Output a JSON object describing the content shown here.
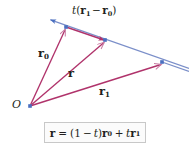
{
  "figure": {
    "background_color": "#ffffff",
    "width": 189,
    "height": 153,
    "colors": {
      "vector": "#b0336b",
      "line": "#6f86c4",
      "point": "#4a6fc0",
      "text": "#231f20",
      "box_border": "#c8c8c8",
      "box_fill": "#fbfbfb"
    },
    "origin_label": "O",
    "labels": {
      "r0": {
        "symbol": "r",
        "subscript": "0",
        "text": "r0"
      },
      "r": {
        "symbol": "r",
        "subscript": "",
        "text": "r"
      },
      "r1": {
        "symbol": "r",
        "subscript": "1",
        "text": "r1"
      },
      "t_diff": {
        "text": "t(r1 − r0)",
        "scalar": "t",
        "open": "(",
        "first": "r",
        "first_sub": "1",
        "minus": "−",
        "second": "r",
        "second_sub": "0",
        "close": ")"
      }
    },
    "equation": {
      "text": "r = (1 − t)r0 + t r1",
      "lhs": "r",
      "eq": "=",
      "open": "(",
      "one": "1",
      "minus": "−",
      "t": "t",
      "close": ")",
      "r0": "r",
      "r0_sub": "0",
      "plus": "+",
      "t2": "t",
      "r1": "r",
      "r1_sub": "1"
    },
    "geometry": {
      "origin": [
        30,
        106
      ],
      "p_r0": [
        66,
        27
      ],
      "p_r": [
        105,
        40
      ],
      "p_r1": [
        162,
        62
      ],
      "line_start": [
        46,
        18
      ],
      "line_end": [
        189,
        68
      ]
    }
  }
}
